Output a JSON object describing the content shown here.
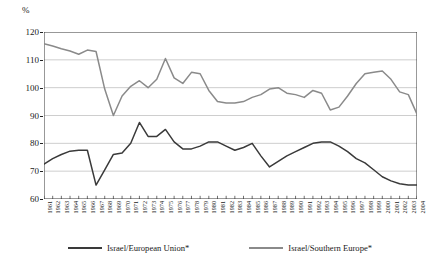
{
  "axis": {
    "unit_label": "%",
    "y_ticks": [
      60,
      70,
      80,
      90,
      100,
      110,
      120
    ]
  },
  "legend": {
    "items": [
      {
        "label": "Israel/European Union*",
        "color": "#3a3a3a",
        "key": "israel_eu"
      },
      {
        "label": "Israel/Southern Europe*",
        "color": "#8a8a8a",
        "key": "israel_se"
      }
    ]
  },
  "chart_data": {
    "type": "line",
    "title": "",
    "subtitle": "",
    "xlabel": "",
    "ylabel": "%",
    "ylim": [
      60,
      120
    ],
    "xlim": [
      1961,
      2004
    ],
    "grid": true,
    "legend_position": "bottom",
    "x": [
      1961,
      1962,
      1963,
      1964,
      1965,
      1966,
      1967,
      1968,
      1969,
      1970,
      1971,
      1972,
      1973,
      1974,
      1975,
      1976,
      1977,
      1978,
      1979,
      1980,
      1981,
      1982,
      1983,
      1984,
      1985,
      1986,
      1987,
      1988,
      1989,
      1990,
      1991,
      1992,
      1993,
      1994,
      1995,
      1996,
      1997,
      1998,
      1999,
      2000,
      2001,
      2002,
      2003,
      2004
    ],
    "categories": [
      "1961",
      "1962",
      "1963",
      "1964",
      "1965",
      "1966",
      "1967",
      "1968",
      "1969",
      "1970",
      "1971",
      "1972",
      "1973",
      "1974",
      "1975",
      "1976",
      "1977",
      "1978",
      "1979",
      "1980",
      "1981",
      "1982",
      "1983",
      "1984",
      "1985",
      "1986",
      "1987",
      "1988",
      "1989",
      "1990",
      "1991",
      "1992",
      "1993",
      "1994",
      "1995",
      "1996",
      "1997",
      "1998",
      "1999",
      "2000",
      "2001",
      "2002",
      "2003",
      "2004"
    ],
    "series": [
      {
        "name": "Israel/European Union*",
        "color": "#3a3a3a",
        "values": [
          72.5,
          74.5,
          76.0,
          77.2,
          77.5,
          77.5,
          65.0,
          70.5,
          76.0,
          76.5,
          80.0,
          87.5,
          82.5,
          82.5,
          85.0,
          80.5,
          78.0,
          78.0,
          79.0,
          80.5,
          80.5,
          79.0,
          77.5,
          78.5,
          80.0,
          75.5,
          71.5,
          73.5,
          75.5,
          77.0,
          78.5,
          80.0,
          80.5,
          80.5,
          79.0,
          77.0,
          74.5,
          73.0,
          70.5,
          68.0,
          66.5,
          65.5,
          65.0,
          65.0
        ]
      },
      {
        "name": "Israel/Southern Europe*",
        "color": "#8a8a8a",
        "values": [
          115.8,
          115.0,
          114.0,
          113.2,
          112.0,
          113.5,
          113.0,
          99.5,
          90.0,
          97.0,
          100.5,
          102.5,
          100.0,
          103.0,
          110.5,
          103.5,
          101.5,
          105.5,
          105.0,
          99.0,
          95.0,
          94.5,
          94.5,
          95.0,
          96.5,
          97.5,
          99.5,
          100.0,
          98.0,
          97.5,
          96.5,
          99.0,
          98.0,
          92.0,
          93.0,
          97.0,
          101.5,
          105.0,
          105.5,
          106.0,
          103.0,
          98.5,
          97.5,
          90.5
        ]
      }
    ]
  }
}
